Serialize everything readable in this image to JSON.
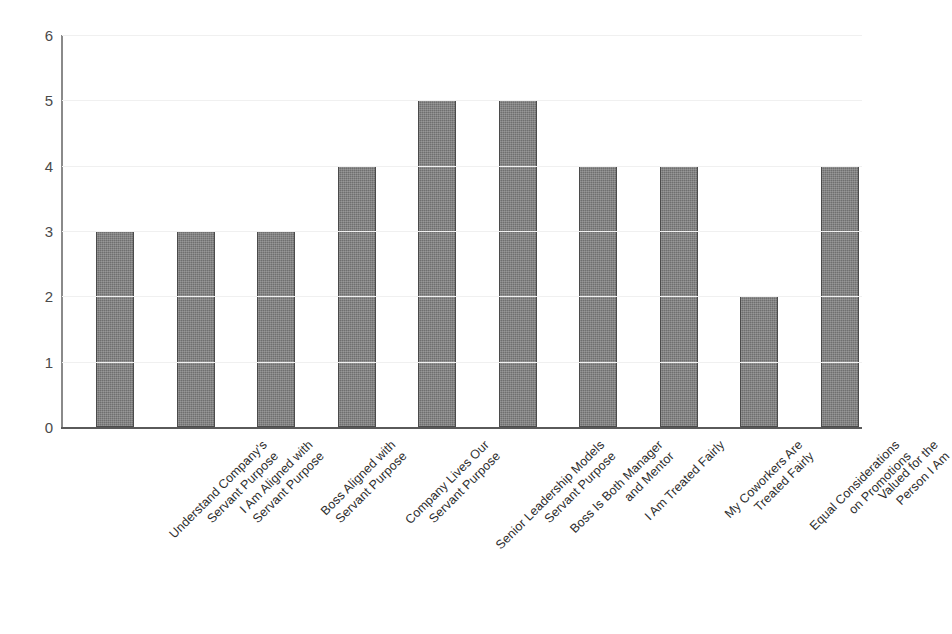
{
  "chart_data": {
    "type": "bar",
    "title": "",
    "subtitle": "",
    "xlabel": "",
    "ylabel": "",
    "ylim": [
      0,
      6
    ],
    "y_ticks": [
      0,
      1,
      2,
      3,
      4,
      5,
      6
    ],
    "grid": true,
    "legend": false,
    "legend_position": "none",
    "orientation": "vertical",
    "bar_color": "#6f6f6f",
    "bar_edge_color": "#4b4b4b",
    "gridline_color": "#f0f0f0",
    "axis_color": "#5a5a5a",
    "background_color": "#ffffff",
    "label_rotation_degrees": -45,
    "categories": [
      "Understand Company's Servant Purpose",
      "I Am Aligned with Servant Purpose",
      "Boss Aligned with Servant Purpose",
      "Company Lives Our Servant Purpose",
      "Senior Leadership Models Servant Purpose",
      "Boss Is Both Manager and Mentor",
      "I Am Treated Fairly",
      "My Coworkers Are Treated Fairly",
      "Equal Considerations on Promotions",
      "Valued for the Person I Am"
    ],
    "category_lines": [
      [
        "Understand Company's",
        "Servant Purpose"
      ],
      [
        "I Am Aligned with",
        "Servant Purpose"
      ],
      [
        "Boss Aligned with",
        "Servant Purpose"
      ],
      [
        "Company Lives Our",
        "Servant Purpose"
      ],
      [
        "Senior Leadership Models",
        "Servant Purpose"
      ],
      [
        "Boss Is Both Manager",
        "and Mentor"
      ],
      [
        "I Am Treated Fairly"
      ],
      [
        "My Coworkers Are",
        "Treated Fairly"
      ],
      [
        "Equal Considerations",
        "on Promotions"
      ],
      [
        "Valued for the",
        "Person I Am"
      ]
    ],
    "values": [
      3,
      3,
      3,
      4,
      5,
      5,
      4,
      4,
      2,
      4
    ]
  }
}
